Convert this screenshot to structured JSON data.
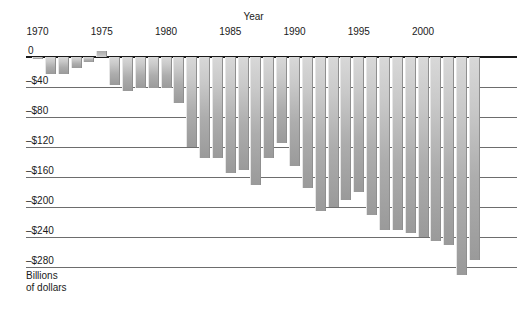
{
  "chart_data": {
    "type": "bar",
    "title": "",
    "xlabel": "Year",
    "ylabel": "Billions of dollars",
    "ylabel_lines": [
      "Billions",
      "of dollars"
    ],
    "ylim": [
      -300,
      20
    ],
    "grid": true,
    "legend": "none",
    "y_ticks": [
      0,
      -40,
      -80,
      -120,
      -160,
      -200,
      -240,
      -280
    ],
    "y_tick_labels": [
      "0",
      "–$40",
      "–$80",
      "–$120",
      "–$160",
      "–$200",
      "–$240",
      "–$280"
    ],
    "x_ticks": [
      1970,
      1975,
      1980,
      1985,
      1990,
      1995,
      2000
    ],
    "x_tick_labels": [
      "1970",
      "1975",
      "1980",
      "1985",
      "1990",
      "1995",
      "2000"
    ],
    "categories": [
      1970,
      1971,
      1972,
      1973,
      1974,
      1975,
      1976,
      1977,
      1978,
      1979,
      1980,
      1981,
      1982,
      1983,
      1984,
      1985,
      1986,
      1987,
      1988,
      1989,
      1990,
      1991,
      1992,
      1993,
      1994,
      1995,
      1996,
      1997,
      1998,
      1999,
      2000,
      2001,
      2002,
      2003,
      2004
    ],
    "values": [
      -3,
      -23,
      -23,
      -15,
      -6,
      8,
      -37,
      -45,
      -41,
      -41,
      -41,
      -61,
      -120,
      -135,
      -135,
      -155,
      -150,
      -170,
      -135,
      -115,
      -145,
      -175,
      -205,
      -200,
      -190,
      -180,
      -210,
      -230,
      -230,
      -235,
      -240,
      -245,
      -250,
      -290,
      -270
    ],
    "bar_color_top": "#d8d8d8",
    "bar_color_bottom": "#9a9a9a",
    "grid_color": "#6d6d6d",
    "baseline_color": "#1a1a1a"
  }
}
